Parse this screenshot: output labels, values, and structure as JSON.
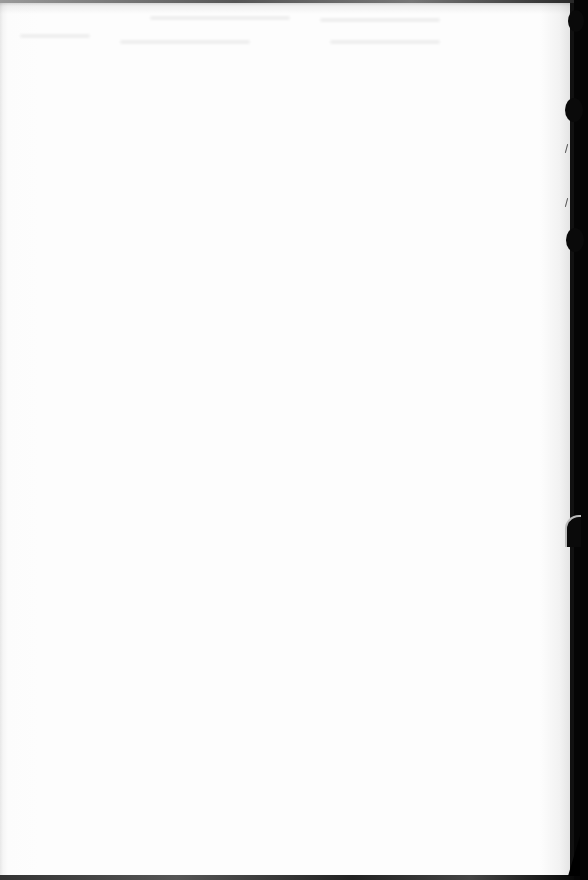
{
  "document": {
    "type": "scanned-page",
    "content": "",
    "visible_text": [],
    "page_color": "#fdfdfd",
    "scan_border_color": "#000000"
  }
}
